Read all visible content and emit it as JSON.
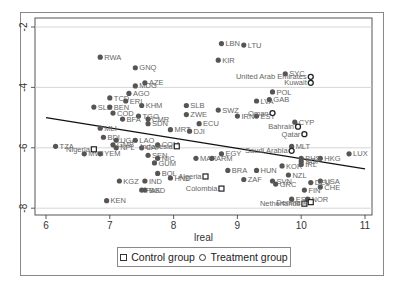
{
  "chart_data": {
    "type": "scatter",
    "title": "",
    "xlabel": "lreal",
    "ylabel": "",
    "xlim": [
      5.9,
      11.1
    ],
    "ylim": [
      -8.2,
      -1.8
    ],
    "x_ticks": [
      "6",
      "7",
      "8",
      "9",
      "10",
      "11"
    ],
    "y_ticks": [
      "-2",
      "-4",
      "-6",
      "-8"
    ],
    "y_tick_values": [
      -2,
      -4,
      -6,
      -8
    ],
    "grid": "horizontal",
    "legend": {
      "position": "bottom",
      "entries": [
        "Control group",
        "Treatment group"
      ]
    },
    "fit_line": {
      "x": [
        6.0,
        11.0
      ],
      "y": [
        -5.0,
        -6.7
      ]
    },
    "series": [
      {
        "name": "Other countries",
        "marker": "filled-circle",
        "points": [
          {
            "label": "RWA",
            "x": 6.85,
            "y": -3.0
          },
          {
            "label": "LBN",
            "x": 8.75,
            "y": -2.55
          },
          {
            "label": "LTU",
            "x": 9.1,
            "y": -2.6
          },
          {
            "label": "KIR",
            "x": 8.7,
            "y": -3.1
          },
          {
            "label": "GNQ",
            "x": 7.4,
            "y": -3.35
          },
          {
            "label": "MDG",
            "x": 7.4,
            "y": -3.95
          },
          {
            "label": "AZE",
            "x": 7.55,
            "y": -3.85
          },
          {
            "label": "TCD",
            "x": 7.0,
            "y": -4.35
          },
          {
            "label": "AGO",
            "x": 7.3,
            "y": -4.2
          },
          {
            "label": "ERI",
            "x": 7.25,
            "y": -4.45
          },
          {
            "label": "SLE",
            "x": 6.75,
            "y": -4.65
          },
          {
            "label": "BEN",
            "x": 7.0,
            "y": -4.65
          },
          {
            "label": "KHM",
            "x": 7.5,
            "y": -4.6
          },
          {
            "label": "COD",
            "x": 7.05,
            "y": -4.85
          },
          {
            "label": "TGO",
            "x": 7.45,
            "y": -4.95
          },
          {
            "label": "BFA",
            "x": 7.2,
            "y": -5.05
          },
          {
            "label": "SDN",
            "x": 7.6,
            "y": -5.2
          },
          {
            "label": "CMR",
            "x": 7.6,
            "y": -5.05
          },
          {
            "label": "MLI",
            "x": 6.85,
            "y": -5.35
          },
          {
            "label": "MRT",
            "x": 7.95,
            "y": -5.4
          },
          {
            "label": "DJI",
            "x": 8.25,
            "y": -5.45
          },
          {
            "label": "SLB",
            "x": 8.2,
            "y": -4.6
          },
          {
            "label": "ZWE",
            "x": 8.2,
            "y": -4.9
          },
          {
            "label": "SWZ",
            "x": 8.7,
            "y": -4.75
          },
          {
            "label": "ECU",
            "x": 8.4,
            "y": -5.2
          },
          {
            "label": "LVA",
            "x": 9.3,
            "y": -4.45
          },
          {
            "label": "GAB",
            "x": 9.5,
            "y": -4.4
          },
          {
            "label": "POL",
            "x": 9.55,
            "y": -4.15
          },
          {
            "label": "IRN",
            "x": 9.0,
            "y": -4.95
          },
          {
            "label": "EST",
            "x": 9.3,
            "y": -4.95
          },
          {
            "label": "CYP",
            "x": 9.9,
            "y": -5.15
          },
          {
            "label": "MLT",
            "x": 9.85,
            "y": -5.95
          },
          {
            "label": "SYC",
            "x": 9.75,
            "y": -3.55
          },
          {
            "label": "BDI",
            "x": 6.9,
            "y": -5.65
          },
          {
            "label": "TZA",
            "x": 6.15,
            "y": -5.95
          },
          {
            "label": "MWI",
            "x": 6.6,
            "y": -6.2
          },
          {
            "label": "YEM",
            "x": 6.85,
            "y": -6.2
          },
          {
            "label": "UGA",
            "x": 7.1,
            "y": -5.75
          },
          {
            "label": "LAO",
            "x": 7.4,
            "y": -5.75
          },
          {
            "label": "COM",
            "x": 7.75,
            "y": -5.9
          },
          {
            "label": "CAF",
            "x": 7.5,
            "y": -6.0
          },
          {
            "label": "GMB",
            "x": 7.05,
            "y": -5.9
          },
          {
            "label": "NPL",
            "x": 7.1,
            "y": -6.0
          },
          {
            "label": "SEN",
            "x": 7.6,
            "y": -6.25
          },
          {
            "label": "NIC",
            "x": 7.75,
            "y": -6.35
          },
          {
            "label": "GUM",
            "x": 7.7,
            "y": -6.5
          },
          {
            "label": "KGZ",
            "x": 7.15,
            "y": -7.1
          },
          {
            "label": "BOL",
            "x": 7.75,
            "y": -6.85
          },
          {
            "label": "IND",
            "x": 7.55,
            "y": -7.1
          },
          {
            "label": "BGD",
            "x": 7.55,
            "y": -7.4
          },
          {
            "label": "PAK",
            "x": 7.5,
            "y": -7.4
          },
          {
            "label": "KEN",
            "x": 6.95,
            "y": -7.75
          },
          {
            "label": "HND",
            "x": 7.95,
            "y": -7.0
          },
          {
            "label": "MAR",
            "x": 8.35,
            "y": -6.35
          },
          {
            "label": "EGY",
            "x": 8.75,
            "y": -6.2
          },
          {
            "label": "ARM",
            "x": 8.6,
            "y": -6.35
          },
          {
            "label": "BRA",
            "x": 8.85,
            "y": -6.75
          },
          {
            "label": "ZAF",
            "x": 9.1,
            "y": -7.05
          },
          {
            "label": "HUN",
            "x": 9.3,
            "y": -6.75
          },
          {
            "label": "SVN",
            "x": 9.55,
            "y": -7.1
          },
          {
            "label": "GRC",
            "x": 9.6,
            "y": -7.2
          },
          {
            "label": "HKG",
            "x": 10.3,
            "y": -6.35
          },
          {
            "label": "LUX",
            "x": 10.75,
            "y": -6.2
          },
          {
            "label": "NZL",
            "x": 9.8,
            "y": -6.9
          },
          {
            "label": "USA",
            "x": 10.3,
            "y": -7.1
          },
          {
            "label": "CHE",
            "x": 10.3,
            "y": -7.3
          },
          {
            "label": "FIN",
            "x": 10.05,
            "y": -7.4
          },
          {
            "label": "ESP",
            "x": 9.85,
            "y": -7.7
          },
          {
            "label": "NOR",
            "x": 10.1,
            "y": -7.7
          },
          {
            "label": "DEU",
            "x": 10.15,
            "y": -7.15
          },
          {
            "label": "BHS",
            "x": 10.0,
            "y": -6.35
          },
          {
            "label": "KOR",
            "x": 9.7,
            "y": -6.6
          },
          {
            "label": "IRL",
            "x": 10.0,
            "y": -6.55
          },
          {
            "label": "SGP",
            "x": 10.0,
            "y": -6.45
          }
        ]
      },
      {
        "name": "Control group",
        "marker": "hollow-square",
        "points": [
          {
            "label": "Nigeria",
            "x": 6.75,
            "y": -6.05
          },
          {
            "label": "Indonesia",
            "x": 8.05,
            "y": -5.95
          },
          {
            "label": "Algeria",
            "x": 8.5,
            "y": -6.95
          },
          {
            "label": "Colombia",
            "x": 8.75,
            "y": -7.35
          },
          {
            "label": "Netherlands",
            "x": 10.05,
            "y": -7.85
          },
          {
            "label": "Denmark",
            "x": 10.15,
            "y": -7.8
          }
        ]
      },
      {
        "name": "Treatment group",
        "marker": "hollow-circle",
        "points": [
          {
            "label": "United Arab Emirates",
            "x": 10.15,
            "y": -3.65
          },
          {
            "label": "Kuwait",
            "x": 10.15,
            "y": -3.85
          },
          {
            "label": "Oman",
            "x": 9.55,
            "y": -4.85
          },
          {
            "label": "Bahrain",
            "x": 9.95,
            "y": -5.3
          },
          {
            "label": "Qatar",
            "x": 10.05,
            "y": -5.55
          },
          {
            "label": "Saudi Arabia",
            "x": 9.85,
            "y": -6.1
          }
        ]
      }
    ]
  }
}
